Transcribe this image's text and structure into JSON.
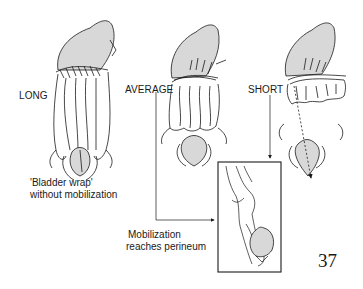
{
  "figure": {
    "labels": {
      "long": "LONG",
      "average": "AVERAGE",
      "short": "SHORT"
    },
    "captions": {
      "bladder_wrap_line1": "'Bladder wrap'",
      "bladder_wrap_line2": "without mobilization",
      "mobilization_line1": "Mobilization",
      "mobilization_line2": "reaches perineum"
    },
    "colors": {
      "ink": "#1a1a1a",
      "fill": "#d8d8d8",
      "paper": "#ffffff"
    }
  },
  "page": {
    "number": "37"
  }
}
